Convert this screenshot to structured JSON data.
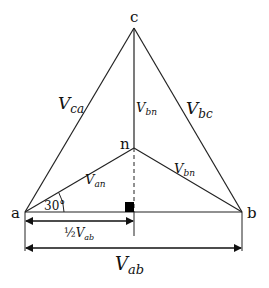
{
  "diagram": {
    "vertices": {
      "a": "a",
      "b": "b",
      "c": "c",
      "n": "n"
    },
    "labels": {
      "v_ca": {
        "base": "V",
        "sub": "ca"
      },
      "v_bc": {
        "base": "V",
        "sub": "bc"
      },
      "v_bn_vertical": {
        "base": "V",
        "sub": "bn"
      },
      "v_bn_diag": {
        "base": "V",
        "sub": "bn"
      },
      "v_an": {
        "base": "V",
        "sub": "an"
      },
      "half_v_ab": {
        "prefix": "½",
        "base": "V",
        "sub": "ab"
      },
      "v_ab": {
        "base": "V",
        "sub": "ab"
      }
    },
    "angle": "30°"
  }
}
